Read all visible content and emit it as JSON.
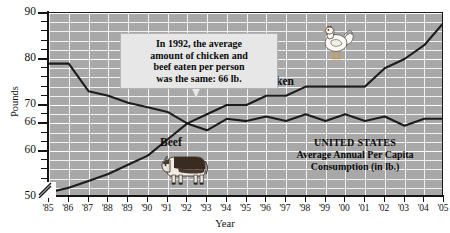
{
  "chart_data": {
    "type": "line",
    "title": "",
    "xlabel": "Year",
    "ylabel": "Pounds",
    "ylim": [
      50,
      90
    ],
    "grid": true,
    "legend_position": "inline-labels",
    "categories": [
      "'85",
      "'86",
      "'87",
      "'88",
      "'89",
      "'90",
      "'91",
      "'92",
      "'93",
      "'94",
      "'95",
      "'96",
      "'97",
      "'98",
      "'99",
      "'00",
      "'01",
      "'02",
      "'03",
      "'04",
      "'05"
    ],
    "series": [
      {
        "name": "Beef",
        "values": [
          79,
          79,
          73,
          72,
          70.5,
          69.5,
          68.5,
          66,
          64.5,
          67,
          66.5,
          67.5,
          66.5,
          68,
          66.5,
          68,
          66.5,
          67.5,
          65.5,
          67,
          67
        ]
      },
      {
        "name": "Chicken",
        "values": [
          51,
          52,
          53.5,
          55,
          57,
          59,
          62.5,
          66,
          68,
          70,
          70,
          72,
          72,
          74,
          74,
          74,
          74,
          78,
          80,
          83,
          88
        ]
      }
    ],
    "y_ticks": [
      50,
      60,
      66,
      70,
      80,
      90
    ],
    "y_axis_break": true,
    "annotations": {
      "callout": "In 1992, the average amount of chicken and beef eaten per person was the same: 66 lb.",
      "callout_target_year": "'92",
      "callout_target_value": 66
    }
  },
  "axes": {
    "y_title": "Pounds",
    "x_title": "Year",
    "y_tick_labels": [
      "90",
      "80",
      "70",
      "66",
      "60",
      "50"
    ],
    "x_tick_labels": [
      "'85",
      "'86",
      "'87",
      "'88",
      "'89",
      "'90",
      "'91",
      "'92",
      "'93",
      "'94",
      "'95",
      "'96",
      "'97",
      "'98",
      "'99",
      "'00",
      "'01",
      "'02",
      "'03",
      "'04",
      "'05"
    ]
  },
  "series_labels": {
    "chicken": "Chicken",
    "beef": "Beef"
  },
  "callout": {
    "line1": "In 1992, the average",
    "line2": "amount of chicken and",
    "line3": "beef eaten per person",
    "line4": "was the same: 66 lb."
  },
  "corner_note": {
    "line1": "UNITED STATES",
    "line2": "Average Annual Per Capita",
    "line3": "Consumption (in lb.)"
  },
  "icons": {
    "cow": "cow-icon",
    "chicken": "rooster-icon"
  },
  "colors": {
    "plot_background": "#a8a8a8",
    "gridline": "#f2f2f2",
    "series_line": "#1c1c1c",
    "axis": "#141414",
    "callout_background": "#e7e7e7",
    "text": "#0a0a0a"
  }
}
